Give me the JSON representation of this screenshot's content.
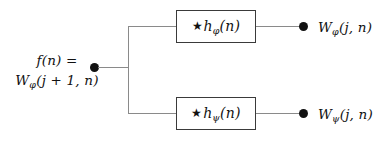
{
  "diagram": {
    "type": "block-diagram",
    "colors": {
      "background": "#ffffff",
      "wire": "#8a8a8a",
      "box_border": "#3a3a3a",
      "dot": "#111111",
      "text": "#111111"
    }
  },
  "input": {
    "line1": "f(n) =",
    "line2_symbol": "W",
    "line2_subscript": "φ",
    "line2_args": "(j + 1, n)",
    "dot_name": "input-node"
  },
  "branches": [
    {
      "id": "approximation",
      "filter": {
        "operator": "★",
        "symbol": "h",
        "subscript": "φ",
        "args": "(n)"
      },
      "output": {
        "symbol": "W",
        "subscript": "φ",
        "args": "(j, n)"
      }
    },
    {
      "id": "detail",
      "filter": {
        "operator": "★",
        "symbol": "h",
        "subscript": "ψ",
        "args": "(n)"
      },
      "output": {
        "symbol": "W",
        "subscript": "ψ",
        "args": "(j, n)"
      }
    }
  ]
}
